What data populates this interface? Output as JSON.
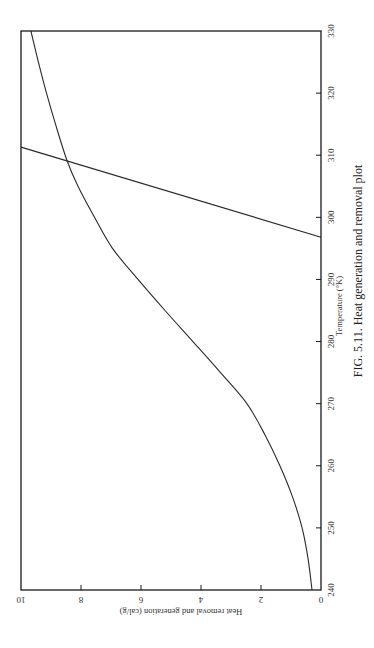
{
  "chart_data": {
    "type": "line",
    "title": "FIG. 5.11. Heat generation and removal plot",
    "xlabel": "Temperature (°K)",
    "ylabel": "Heat removal and generation (cal/g)",
    "xlim": [
      240,
      330
    ],
    "ylim": [
      0,
      10
    ],
    "x_ticks": [
      240,
      250,
      260,
      270,
      280,
      290,
      300,
      310,
      320,
      330
    ],
    "y_ticks": [
      0,
      2,
      4,
      6,
      8,
      10
    ],
    "grid": false,
    "legend": null,
    "orientation": "rotated 90° clockwise on page (temperature axis runs vertically along right edge)",
    "series": [
      {
        "name": "Heat generation",
        "x": [
          240,
          245,
          250,
          255,
          260,
          265,
          270,
          275,
          280,
          285,
          290,
          295,
          300,
          305,
          309.2,
          315,
          320,
          325,
          330
        ],
        "y": [
          0.3,
          0.43,
          0.63,
          0.95,
          1.37,
          1.87,
          2.47,
          3.35,
          4.27,
          5.2,
          6.1,
          6.95,
          7.55,
          8.1,
          8.47,
          8.85,
          9.15,
          9.42,
          9.67
        ]
      },
      {
        "name": "Heat removal",
        "x": [
          296.8,
          311.3
        ],
        "y": [
          0,
          10
        ]
      }
    ],
    "intersection": {
      "x": 309.2,
      "y": 8.47
    }
  }
}
